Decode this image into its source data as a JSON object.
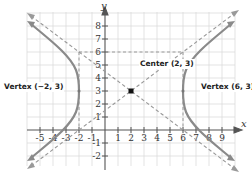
{
  "diagram": {
    "type": "hyperbola",
    "equation": "(x-2)^2/16 - (y-3)^2/9 = 1",
    "axes": {
      "x_label": "x",
      "y_label": "y"
    },
    "x_ticks": [
      "-5",
      "-4",
      "-3",
      "-2",
      "-1",
      "1",
      "2",
      "3",
      "4",
      "5",
      "6",
      "7",
      "8",
      "9"
    ],
    "y_ticks": [
      "-2",
      "-1",
      "1",
      "2",
      "3",
      "4",
      "5",
      "6",
      "7",
      "8"
    ],
    "labels": {
      "center": "Center (2, 3)",
      "vertex_left": "Vertex (−2, 3)",
      "vertex_right": "Vertex (6, 3)"
    },
    "points": {
      "center": [
        2,
        3
      ],
      "vertex_left": [
        -2,
        3
      ],
      "vertex_right": [
        6,
        3
      ]
    },
    "box": {
      "x_min": -2,
      "x_max": 6,
      "y_min": 0,
      "y_max": 6
    },
    "colors": {
      "curve": "#8a8a8a",
      "dashed": "#9a9a9a",
      "grid": "#dcdcdc",
      "axis": "#555555"
    }
  }
}
